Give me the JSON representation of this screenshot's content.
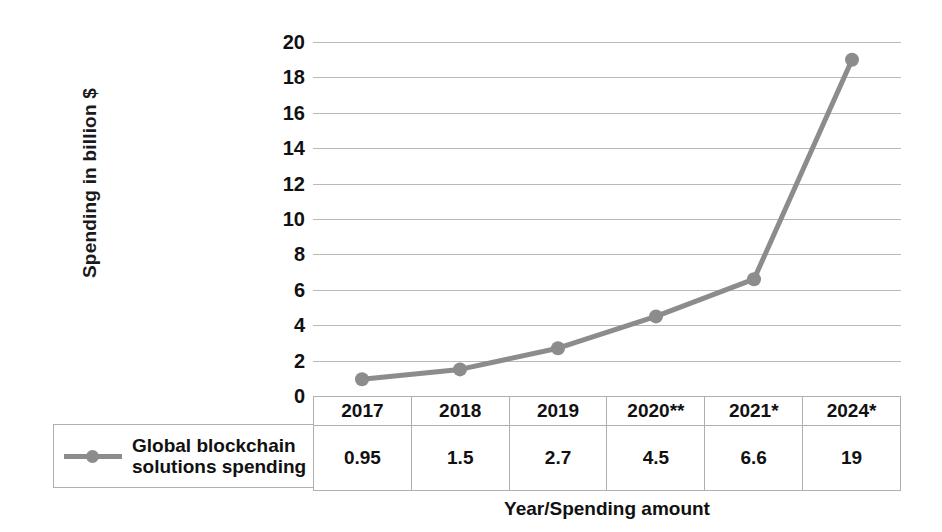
{
  "chart_data": {
    "type": "line",
    "title": "",
    "xlabel": "Year/Spending amount",
    "ylabel": "Spending in billion $",
    "categories": [
      "2017",
      "2018",
      "2019",
      "2020**",
      "2021*",
      "2024*"
    ],
    "values": [
      0.95,
      1.5,
      2.7,
      4.5,
      6.6,
      19
    ],
    "value_labels": [
      "0.95",
      "1.5",
      "2.7",
      "4.5",
      "6.6",
      "19"
    ],
    "series": [
      {
        "name": "Global blockchain solutions spending",
        "values": [
          0.95,
          1.5,
          2.7,
          4.5,
          6.6,
          19
        ],
        "color": "#8c8c8c",
        "marker": "circle"
      }
    ],
    "ylim": [
      0,
      20
    ],
    "ytick_step": 2,
    "yticks": [
      "20",
      "18",
      "16",
      "14",
      "12",
      "10",
      "8",
      "6",
      "4",
      "2",
      "0"
    ],
    "grid": true,
    "legend_position": "bottom-left",
    "has_data_table": true
  },
  "axes": {
    "y_title": "Spending in billion $",
    "x_title": "Year/Spending amount"
  },
  "legend": {
    "entries": [
      {
        "label_line1": "Global blockchain",
        "label_line2": "solutions spending",
        "color": "#8c8c8c"
      }
    ]
  },
  "table": {
    "headers": [
      "2017",
      "2018",
      "2019",
      "2020**",
      "2021*",
      "2024*"
    ],
    "rows": [
      {
        "values": [
          "0.95",
          "1.5",
          "2.7",
          "4.5",
          "6.6",
          "19"
        ]
      }
    ]
  },
  "colors": {
    "series": "#8c8c8c",
    "gridline": "#b9b9b9",
    "border": "#b0b0b0",
    "text": "#111111",
    "background": "#ffffff"
  }
}
